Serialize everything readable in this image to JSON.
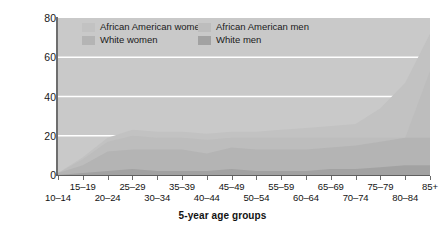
{
  "figure": {
    "background_color": "#ffffff",
    "plot_background_color": "#c9c9c9",
    "gridline_color": "#ffffff",
    "axis_color": "#6b6b6b"
  },
  "axes": {
    "ylabel": "Rates per 100,000",
    "xlabel": "5-year age groups",
    "yticks": [
      "0",
      "20",
      "40",
      "60",
      "80"
    ],
    "ytick_values": [
      0,
      20,
      40,
      60,
      80
    ],
    "ylim": [
      0,
      80
    ],
    "xtick_labels_top": [
      "15–19",
      "25–29",
      "35–39",
      "45–49",
      "55–59",
      "65–69",
      "75–79",
      "85+"
    ],
    "xtick_labels_bottom": [
      "10–14",
      "20–24",
      "30–34",
      "40–44",
      "50–54",
      "60–64",
      "70–74",
      "80–84"
    ]
  },
  "legend": {
    "position": "inside-top",
    "entries": [
      {
        "label": "African American women",
        "color": "#c2c2c2",
        "row": 1,
        "col": 1
      },
      {
        "label": "African American men",
        "color": "#bdbdbd",
        "row": 1,
        "col": 2
      },
      {
        "label": "White women",
        "color": "#b4b4b4",
        "row": 2,
        "col": 1
      },
      {
        "label": "White men",
        "color": "#a2a2a2",
        "row": 2,
        "col": 2
      }
    ]
  },
  "chart_data": {
    "type": "area",
    "title": "",
    "subtitle": "",
    "xlabel": "5-year age groups",
    "ylabel": "Rates per 100,000",
    "ylim": [
      0,
      80
    ],
    "grid": true,
    "legend_position": "inside-top",
    "overlapping": true,
    "categories": [
      "10–14",
      "15–19",
      "20–24",
      "25–29",
      "30–34",
      "35–39",
      "40–44",
      "45–49",
      "50–54",
      "55–59",
      "60–64",
      "65–69",
      "70–74",
      "75–79",
      "80–84",
      "85+"
    ],
    "series": [
      {
        "name": "African American men",
        "color": "#c2c2c2",
        "values": [
          1,
          9,
          19,
          23,
          22,
          22,
          21,
          22,
          22,
          23,
          24,
          25,
          26,
          34,
          47,
          72
        ]
      },
      {
        "name": "African American women",
        "color": "#bdbdbd",
        "values": [
          1,
          8,
          17,
          20,
          19,
          19,
          18,
          19,
          19,
          19,
          19,
          19,
          19,
          19,
          19,
          53
        ]
      },
      {
        "name": "White men",
        "color": "#b4b4b4",
        "values": [
          1,
          5,
          12,
          13,
          13,
          13,
          11,
          14,
          13,
          13,
          13,
          14,
          15,
          17,
          19,
          19
        ]
      },
      {
        "name": "White women",
        "color": "#a2a2a2",
        "values": [
          0,
          1,
          2,
          3,
          2,
          2,
          2,
          3,
          2,
          2,
          2,
          3,
          3,
          4,
          5,
          5
        ]
      }
    ]
  }
}
